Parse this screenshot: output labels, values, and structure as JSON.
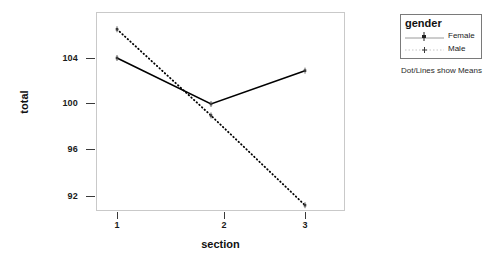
{
  "chart_data": {
    "type": "line",
    "title": "",
    "xlabel": "section",
    "ylabel": "total",
    "categories": [
      "1",
      "2",
      "3"
    ],
    "x": [
      1,
      2,
      3
    ],
    "xlim": [
      0.55,
      3.3
    ],
    "ylim": [
      89.7,
      107.3
    ],
    "yticks": [
      92,
      96,
      100,
      104
    ],
    "ytick_labels": [
      "92",
      "96",
      "100",
      "104"
    ],
    "xticks": [
      1,
      2,
      3
    ],
    "xtick_labels": [
      "1",
      "2",
      "3"
    ],
    "grid": false,
    "legend_position": "right",
    "series": [
      {
        "name": "Female",
        "values": [
          104.0,
          100.0,
          102.9
        ],
        "linestyle": "solid",
        "color": "#000000",
        "marker": "error-bar-point"
      },
      {
        "name": "Male",
        "values": [
          106.5,
          99.0,
          91.2
        ],
        "linestyle": "dotted",
        "color": "#000000",
        "marker": "dot-point"
      }
    ],
    "annotations": [
      "Dot/Lines show Means"
    ]
  },
  "axes": {
    "y_title": "total",
    "x_title": "section",
    "y_tick_labels": [
      "104",
      "100",
      "96",
      "92"
    ],
    "x_tick_labels": [
      "1",
      "2",
      "3"
    ]
  },
  "legend": {
    "title": "gender",
    "items": [
      {
        "label": "Female",
        "key": "solid-line-with-marker"
      },
      {
        "label": "Male",
        "key": "dotted-line-with-dot"
      }
    ],
    "note": "Dot/Lines show Means"
  }
}
